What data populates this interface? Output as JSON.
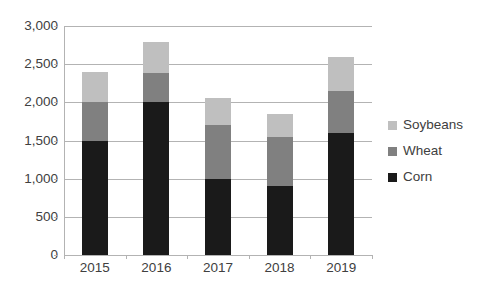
{
  "chart_data": {
    "type": "bar",
    "subtype": "stacked-vertical",
    "title": "",
    "xlabel": "",
    "ylabel": "",
    "categories": [
      "2015",
      "2016",
      "2017",
      "2018",
      "2019"
    ],
    "series": [
      {
        "name": "Corn",
        "color": "#1a1a1a",
        "values": [
          1500,
          2000,
          1000,
          900,
          1600
        ]
      },
      {
        "name": "Wheat",
        "color": "#808080",
        "values": [
          500,
          380,
          700,
          650,
          550
        ]
      },
      {
        "name": "Soybeans",
        "color": "#bfbfbf",
        "values": [
          400,
          410,
          360,
          300,
          450
        ]
      }
    ],
    "stack_totals": [
      2400,
      2790,
      2060,
      1850,
      2600
    ],
    "ylim": [
      0,
      3000
    ],
    "ytick_labels": [
      "0",
      "500",
      "1,000",
      "1,500",
      "2,000",
      "2,500",
      "3,000"
    ],
    "ytick_values": [
      0,
      500,
      1000,
      1500,
      2000,
      2500,
      3000
    ],
    "grid": true,
    "grid_axis": "y",
    "legend_position": "right",
    "legend_entries": [
      "Soybeans",
      "Wheat",
      "Corn"
    ],
    "background_color": "#ffffff",
    "axis_color": "#b3b3b3",
    "text_color": "#404040"
  }
}
